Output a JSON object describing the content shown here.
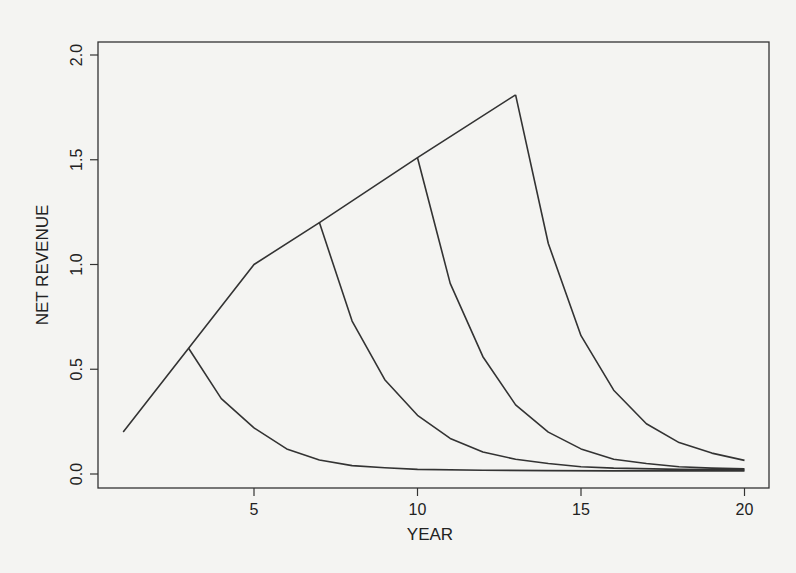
{
  "chart_data": {
    "type": "line",
    "title": "",
    "xlabel": "YEAR",
    "ylabel": "NET REVENUE",
    "xlim": [
      0.3,
      20.8
    ],
    "ylim": [
      -0.05,
      2.06
    ],
    "xticks": [
      5,
      10,
      15,
      20
    ],
    "xtick_labels": [
      "5",
      "10",
      "15",
      "20"
    ],
    "yticks": [
      0.0,
      0.5,
      1.0,
      1.5,
      2.0
    ],
    "ytick_labels": [
      "0.0",
      "0.5",
      "1.0",
      "1.5",
      "2.0"
    ],
    "grid": false,
    "legend": null,
    "line_color": "#333333",
    "series": [
      {
        "name": "growth envelope",
        "x": [
          1,
          3,
          5,
          7,
          10,
          13
        ],
        "y": [
          0.2,
          0.6,
          1.0,
          1.2,
          1.51,
          1.81
        ]
      },
      {
        "name": "decline from year 3",
        "x": [
          3,
          4,
          5,
          6,
          7,
          8,
          9,
          10,
          12,
          14,
          16,
          18,
          20
        ],
        "y": [
          0.6,
          0.36,
          0.22,
          0.12,
          0.067,
          0.04,
          0.03,
          0.022,
          0.018,
          0.016,
          0.015,
          0.015,
          0.015
        ]
      },
      {
        "name": "decline from year 7",
        "x": [
          7,
          8,
          9,
          10,
          11,
          12,
          13,
          14,
          15,
          16,
          18,
          20
        ],
        "y": [
          1.2,
          0.73,
          0.45,
          0.28,
          0.17,
          0.105,
          0.07,
          0.05,
          0.035,
          0.028,
          0.022,
          0.02
        ]
      },
      {
        "name": "decline from year 10",
        "x": [
          10,
          11,
          12,
          13,
          14,
          15,
          16,
          17,
          18,
          19,
          20
        ],
        "y": [
          1.51,
          0.91,
          0.56,
          0.33,
          0.2,
          0.12,
          0.07,
          0.05,
          0.035,
          0.028,
          0.025
        ]
      },
      {
        "name": "decline from year 13",
        "x": [
          13,
          14,
          15,
          16,
          17,
          18,
          19,
          20
        ],
        "y": [
          1.81,
          1.1,
          0.66,
          0.4,
          0.24,
          0.15,
          0.1,
          0.065
        ]
      }
    ]
  }
}
